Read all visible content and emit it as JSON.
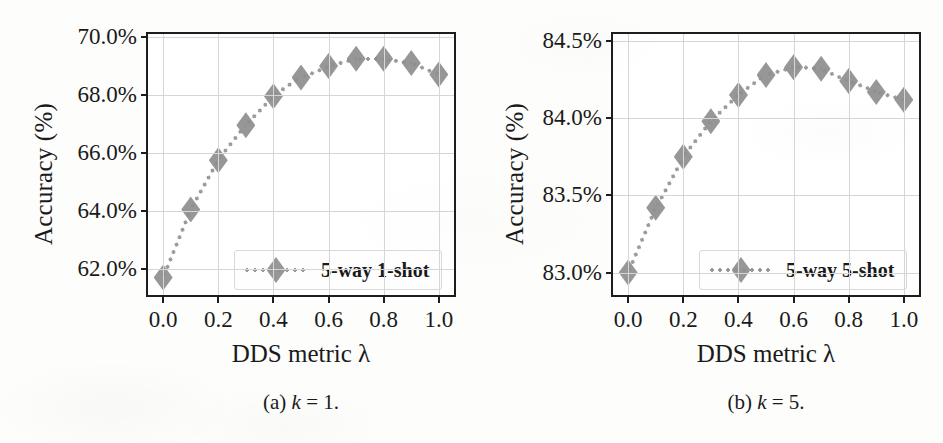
{
  "figure": {
    "background_color": "#fdfdfc",
    "marker_color": "#8f8f8f",
    "line_color": "#9a9a9a",
    "axis_color": "#1d1d1d",
    "grid_color": "#d6d6d6"
  },
  "panels": [
    {
      "id": "a",
      "caption_prefix": "(a)",
      "caption_var": "k",
      "caption_eq": "= 1.",
      "caption_full": "(a) k = 1.",
      "legend_label": "5-way 1-shot"
    },
    {
      "id": "b",
      "caption_prefix": "(b)",
      "caption_var": "k",
      "caption_eq": "= 5.",
      "caption_full": "(b) k = 5.",
      "legend_label": "5-way 5-shot"
    }
  ],
  "chart_data": [
    {
      "type": "line",
      "panel": "a",
      "title": "",
      "caption": "(a) k = 1.",
      "xlabel": "DDS metric λ",
      "ylabel": "Accuracy (%)",
      "x": [
        0.0,
        0.1,
        0.2,
        0.3,
        0.4,
        0.5,
        0.6,
        0.7,
        0.8,
        0.9,
        1.0
      ],
      "xticklabels": [
        "0.0",
        "0.2",
        "0.4",
        "0.6",
        "0.8",
        "1.0"
      ],
      "xtickvalues": [
        0.0,
        0.2,
        0.4,
        0.6,
        0.8,
        1.0
      ],
      "xlim": [
        -0.055,
        1.055
      ],
      "yticklabels": [
        "62.0%",
        "64.0%",
        "66.0%",
        "68.0%",
        "70.0%"
      ],
      "ytickvalues": [
        62.0,
        64.0,
        66.0,
        68.0,
        70.0
      ],
      "ylim": [
        61.1,
        70.1
      ],
      "grid": true,
      "legend_position": "lower right",
      "marker": "diamond",
      "linestyle": "dotted",
      "series": [
        {
          "name": "5-way 1-shot",
          "values": [
            61.7,
            64.05,
            65.75,
            66.95,
            67.95,
            68.6,
            69.0,
            69.25,
            69.25,
            69.1,
            68.7
          ]
        }
      ]
    },
    {
      "type": "line",
      "panel": "b",
      "title": "",
      "caption": "(b) k = 5.",
      "xlabel": "DDS metric λ",
      "ylabel": "Accuracy (%)",
      "x": [
        0.0,
        0.1,
        0.2,
        0.3,
        0.4,
        0.5,
        0.6,
        0.7,
        0.8,
        0.9,
        1.0
      ],
      "xticklabels": [
        "0.0",
        "0.2",
        "0.4",
        "0.6",
        "0.8",
        "1.0"
      ],
      "xtickvalues": [
        0.0,
        0.2,
        0.4,
        0.6,
        0.8,
        1.0
      ],
      "xlim": [
        -0.055,
        1.055
      ],
      "yticklabels": [
        "83.0%",
        "83.5%",
        "84.0%",
        "84.5%"
      ],
      "ytickvalues": [
        83.0,
        83.5,
        84.0,
        84.5
      ],
      "ylim": [
        82.855,
        84.545
      ],
      "grid": true,
      "legend_position": "lower right",
      "marker": "diamond",
      "linestyle": "dotted",
      "series": [
        {
          "name": "5-way 5-shot",
          "values": [
            83.0,
            83.42,
            83.75,
            83.98,
            84.15,
            84.28,
            84.33,
            84.32,
            84.24,
            84.17,
            84.12
          ]
        }
      ]
    }
  ]
}
